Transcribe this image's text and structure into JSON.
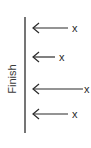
{
  "diagram": {
    "axis_label": "Finish",
    "line_color": "#2b2b2b",
    "axis": {
      "x": 25,
      "y_top": 17,
      "y_bottom": 133
    },
    "arrows": [
      {
        "y": 28,
        "x_tip": 33,
        "x_tail": 68,
        "mark": "x",
        "mark_x": 72
      },
      {
        "y": 57,
        "x_tip": 33,
        "x_tail": 55,
        "mark": "x",
        "mark_x": 59
      },
      {
        "y": 89,
        "x_tip": 33,
        "x_tail": 83,
        "mark": "x",
        "mark_x": 84
      },
      {
        "y": 114,
        "x_tip": 33,
        "x_tail": 68,
        "mark": "x",
        "mark_x": 72
      }
    ]
  }
}
